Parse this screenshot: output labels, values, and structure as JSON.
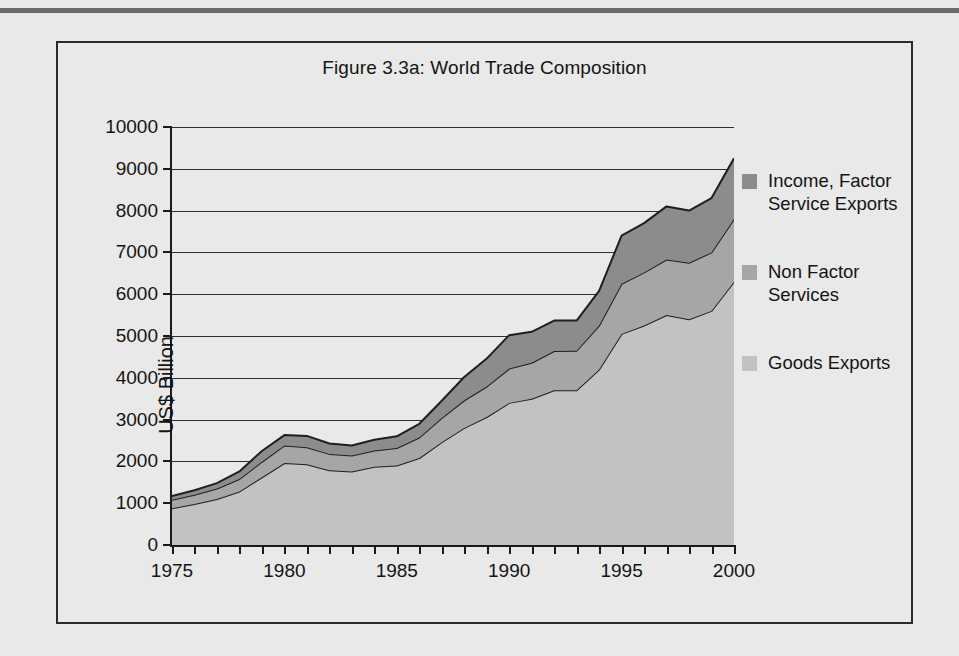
{
  "figure": {
    "title": "Figure 3.3a: World Trade Composition"
  },
  "chart_data": {
    "type": "area",
    "title": "Figure 3.3a: World Trade Composition",
    "xlabel": "",
    "ylabel": "US$ Billion",
    "xlim": [
      1975,
      2000
    ],
    "ylim": [
      0,
      10000
    ],
    "ytick_step": 1000,
    "xtick_step": 1,
    "xtick_label_step": 5,
    "grid": true,
    "stacked": true,
    "legend_position": "right",
    "y_ticks": [
      "0",
      "1000",
      "2000",
      "3000",
      "4000",
      "5000",
      "6000",
      "7000",
      "8000",
      "9000",
      "10000"
    ],
    "x_ticks": [
      "1975",
      "",
      "",
      "",
      "",
      "1980",
      "",
      "",
      "",
      "",
      "1985",
      "",
      "",
      "",
      "",
      "1990",
      "",
      "",
      "",
      "",
      "1995",
      "",
      "",
      "",
      "",
      "2000"
    ],
    "x_tick_labels": [
      "1975",
      "1980",
      "1985",
      "1990",
      "1995",
      "2000"
    ],
    "x": [
      1975,
      1976,
      1977,
      1978,
      1979,
      1980,
      1981,
      1982,
      1983,
      1984,
      1985,
      1986,
      1987,
      1988,
      1989,
      1990,
      1991,
      1992,
      1993,
      1994,
      1995,
      1996,
      1997,
      1998,
      1999,
      2000
    ],
    "series": [
      {
        "name": "Goods Exports",
        "color": "#c2c2c2",
        "values": [
          880,
          980,
          1100,
          1280,
          1620,
          1960,
          1930,
          1790,
          1760,
          1870,
          1900,
          2080,
          2460,
          2800,
          3060,
          3400,
          3500,
          3700,
          3700,
          4200,
          5050,
          5250,
          5500,
          5400,
          5600,
          6300
        ]
      },
      {
        "name": "Non Factor Services",
        "color": "#a6a6a6",
        "values": [
          200,
          220,
          250,
          300,
          370,
          420,
          410,
          390,
          380,
          390,
          420,
          490,
          580,
          660,
          730,
          820,
          860,
          940,
          950,
          1050,
          1200,
          1270,
          1330,
          1350,
          1400,
          1500
        ]
      },
      {
        "name": "Income, Factor Service Exports",
        "color": "#8c8c8c",
        "values": [
          90,
          110,
          130,
          180,
          260,
          250,
          270,
          250,
          240,
          260,
          280,
          330,
          410,
          560,
          670,
          800,
          740,
          730,
          720,
          830,
          1150,
          1180,
          1270,
          1250,
          1300,
          1450
        ]
      }
    ],
    "totals": [
      1170,
      1310,
      1480,
      1760,
      2250,
      2630,
      2610,
      2430,
      2380,
      2520,
      2600,
      2900,
      3450,
      4020,
      4460,
      5020,
      5100,
      5370,
      5370,
      6080,
      7400,
      7700,
      8100,
      8000,
      8300,
      9250
    ]
  },
  "legend": {
    "items": [
      {
        "label_line1": "Income, Factor",
        "label_line2": "Service Exports",
        "color": "#8c8c8c"
      },
      {
        "label_line1": "Non Factor",
        "label_line2": "Services",
        "color": "#a6a6a6"
      },
      {
        "label_line1": "Goods Exports",
        "label_line2": "",
        "color": "#c2c2c2"
      }
    ]
  },
  "colors": {
    "page_background": "#e9e9e9",
    "frame_border": "#2b2b2b",
    "axis": "#1a1a1a",
    "gridline": "#2e2e2e",
    "text": "#141414",
    "top_rule": "#6a6a6a"
  }
}
